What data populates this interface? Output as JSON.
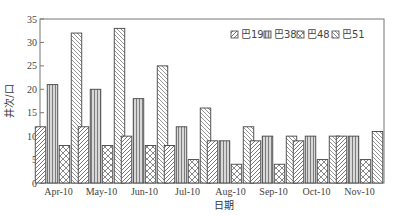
{
  "chart_data": {
    "type": "bar",
    "title": "",
    "xlabel": "日期",
    "ylabel": "井次/口",
    "ylim": [
      0,
      35
    ],
    "yticks": [
      0,
      5,
      10,
      15,
      20,
      25,
      30,
      35
    ],
    "grid": false,
    "legend_position": "top-right-inside",
    "categories": [
      "Apr-10",
      "May-10",
      "Jun-10",
      "Jul-10",
      "Aug-10",
      "Sep-10",
      "Oct-10",
      "Nov-10"
    ],
    "series": [
      {
        "name": "巴19",
        "pattern": "diag-right",
        "values": [
          12,
          12,
          10,
          8,
          9,
          9,
          9,
          10
        ]
      },
      {
        "name": "巴38",
        "pattern": "vertical",
        "values": [
          21,
          20,
          18,
          12,
          9,
          10,
          10,
          10
        ]
      },
      {
        "name": "巴48",
        "pattern": "cross-diag",
        "values": [
          8,
          8,
          8,
          5,
          4,
          4,
          5,
          5
        ]
      },
      {
        "name": "巴51",
        "pattern": "diag-left",
        "values": [
          32,
          33,
          25,
          16,
          12,
          10,
          10,
          11
        ]
      }
    ]
  }
}
